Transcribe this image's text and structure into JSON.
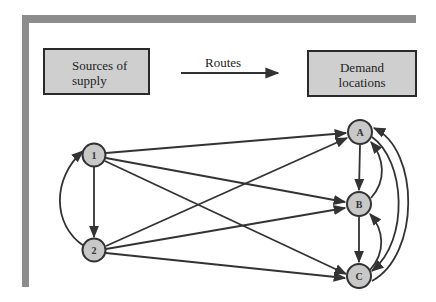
{
  "header": {
    "source_box": {
      "line1": "Sources of",
      "line2": "supply"
    },
    "routes_label": "Routes",
    "demand_box": {
      "line1": "Demand",
      "line2": "locations"
    }
  },
  "nodes": {
    "supply": [
      {
        "id": "1",
        "label": "1",
        "x": 94,
        "y": 155
      },
      {
        "id": "2",
        "label": "2",
        "x": 94,
        "y": 250
      }
    ],
    "demand": [
      {
        "id": "A",
        "label": "A",
        "x": 360,
        "y": 132
      },
      {
        "id": "B",
        "label": "B",
        "x": 359,
        "y": 204
      },
      {
        "id": "C",
        "label": "C",
        "x": 359,
        "y": 276
      }
    ]
  },
  "edges": [
    {
      "from": "1",
      "to": "2",
      "shape": "straight"
    },
    {
      "from": "2",
      "to": "1",
      "shape": "curved-left"
    },
    {
      "from": "1",
      "to": "A",
      "shape": "straight"
    },
    {
      "from": "1",
      "to": "B",
      "shape": "straight"
    },
    {
      "from": "1",
      "to": "C",
      "shape": "straight"
    },
    {
      "from": "2",
      "to": "A",
      "shape": "straight"
    },
    {
      "from": "2",
      "to": "B",
      "shape": "straight"
    },
    {
      "from": "2",
      "to": "C",
      "shape": "straight"
    },
    {
      "from": "A",
      "to": "B",
      "shape": "straight"
    },
    {
      "from": "B",
      "to": "C",
      "shape": "straight"
    },
    {
      "from": "B",
      "to": "A",
      "shape": "curved-right"
    },
    {
      "from": "C",
      "to": "B",
      "shape": "curved-right"
    },
    {
      "from": "A",
      "to": "C",
      "shape": "curved-right-inner"
    },
    {
      "from": "C",
      "to": "A",
      "shape": "curved-right-outer"
    }
  ],
  "colors": {
    "frame": "#8c8c8c",
    "box_fill": "#cfcfcf",
    "node_fill": "#c8c8c8",
    "stroke": "#333333"
  }
}
